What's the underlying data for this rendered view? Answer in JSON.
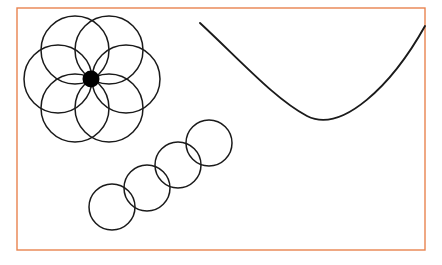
{
  "canvas": {
    "width": 442,
    "height": 265,
    "background_color": "#ffffff"
  },
  "frame": {
    "name": "figure-border",
    "shape": "rectangle",
    "x": 17,
    "y": 8,
    "width": 408,
    "height": 242,
    "stroke_color": "#e8834f",
    "stroke_width": 1.4,
    "fill": "none"
  },
  "style": {
    "ink_color": "#1a1a1a",
    "circle_stroke_width": 1.5,
    "curve_stroke_width": 1.9,
    "dot_fill": "#000000"
  },
  "chart_data": {
    "type": "scatter",
    "title": "",
    "subtitle": "",
    "xlabel": "",
    "ylabel": "",
    "xlim": [
      0,
      442
    ],
    "ylim": [
      0,
      265
    ],
    "grid": false,
    "legend_position": "none",
    "annotations": [],
    "tick_labels": {
      "x": [],
      "y": []
    },
    "groups": [
      {
        "name": "rosette-cluster",
        "description": "six overlapping circles arranged hexagonally around a filled center dot",
        "center": {
          "x": 92,
          "y": 79
        },
        "ring_radius": 34,
        "circle_radius": 34,
        "count": 6,
        "circles": [
          {
            "label": "rosette-circle-top-left",
            "cx": 75,
            "cy": 50,
            "r": 34
          },
          {
            "label": "rosette-circle-top-right",
            "cx": 109,
            "cy": 50,
            "r": 34
          },
          {
            "label": "rosette-circle-right",
            "cx": 126,
            "cy": 79,
            "r": 34
          },
          {
            "label": "rosette-circle-bottom-right",
            "cx": 109,
            "cy": 108,
            "r": 34
          },
          {
            "label": "rosette-circle-bottom-left",
            "cx": 75,
            "cy": 108,
            "r": 34
          },
          {
            "label": "rosette-circle-left",
            "cx": 58,
            "cy": 79,
            "r": 34
          }
        ],
        "center_dot": {
          "label": "rosette-center-dot",
          "cx": 91,
          "cy": 79,
          "r": 8.5
        }
      },
      {
        "name": "diagonal-chain",
        "description": "four overlapping circles forming a chain rising to the upper right",
        "count": 4,
        "circle_radius": 23,
        "circles": [
          {
            "label": "chain-circle-1",
            "cx": 112,
            "cy": 207,
            "r": 23
          },
          {
            "label": "chain-circle-2",
            "cx": 147,
            "cy": 188,
            "r": 23
          },
          {
            "label": "chain-circle-3",
            "cx": 178,
            "cy": 165,
            "r": 23
          },
          {
            "label": "chain-circle-4",
            "cx": 209,
            "cy": 143,
            "r": 23
          }
        ]
      },
      {
        "name": "parabolic-curve",
        "description": "smooth concave-up arc spanning the right half of the frame",
        "start_point": {
          "x": 200,
          "y": 23
        },
        "vertex": {
          "x": 307,
          "y": 116
        },
        "end_point": {
          "x": 425,
          "y": 26
        },
        "path": "M 200 23 C 242 62, 275 99, 307 116 C 342 134, 392 85, 425 26"
      }
    ]
  }
}
